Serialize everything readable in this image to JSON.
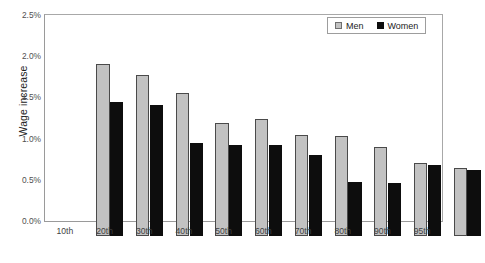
{
  "chart_data": {
    "type": "bar",
    "title": "",
    "xlabel": "",
    "ylabel": "Wage increase",
    "ylim": [
      0,
      2.5
    ],
    "ytick_labels": [
      "0.0%",
      "0.5%",
      "1.0%",
      "1.5%",
      "2.0%",
      "2.5%"
    ],
    "ytick_values": [
      0,
      0.5,
      1.0,
      1.5,
      2.0,
      2.5
    ],
    "grid": false,
    "legend_position": "top-right",
    "categories": [
      "10th",
      "20th",
      "30th",
      "40th",
      "50th",
      "60th",
      "70th",
      "80th",
      "90th",
      "95th"
    ],
    "series": [
      {
        "name": "Men",
        "color": "#c2c2c2",
        "values": [
          2.09,
          1.96,
          1.73,
          1.37,
          1.42,
          1.23,
          1.21,
          1.08,
          0.89,
          0.83
        ]
      },
      {
        "name": "Women",
        "color": "#0d0d0d",
        "values": [
          1.63,
          1.59,
          1.13,
          1.11,
          1.11,
          0.98,
          0.66,
          0.64,
          0.86,
          0.8
        ]
      }
    ]
  },
  "legend": {
    "entries": [
      {
        "label": "Men",
        "swatch": "men-swatch"
      },
      {
        "label": "Women",
        "swatch": "women-swatch"
      }
    ]
  },
  "axis": {
    "y_title": "Wage increase"
  }
}
